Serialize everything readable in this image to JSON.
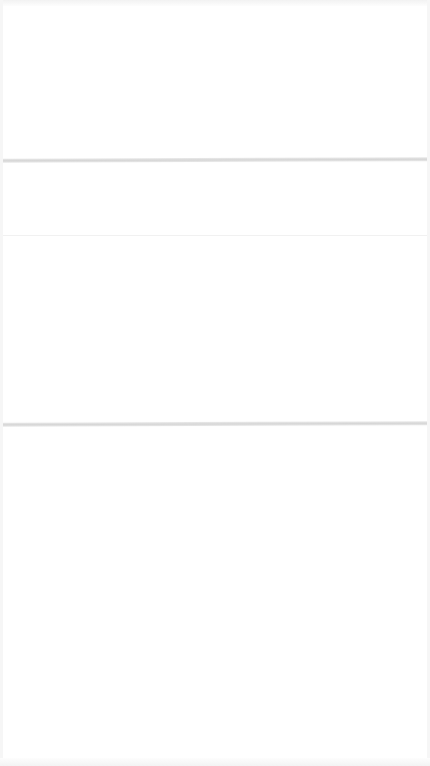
{
  "screen": {
    "background_color": "#ffffff",
    "separator_color": "#d6d6d6",
    "sections": [
      {
        "name": "header-area",
        "text": ""
      },
      {
        "name": "middle-area",
        "text": ""
      },
      {
        "name": "content-area",
        "text": ""
      }
    ]
  }
}
